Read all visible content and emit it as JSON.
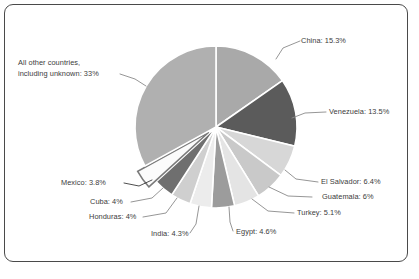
{
  "chart_data": {
    "type": "pie",
    "title": "",
    "xlabel": "",
    "ylabel": "",
    "legend_position": "none",
    "grid": false,
    "unit": "%",
    "start_angle_deg": 0,
    "direction": "clockwise",
    "categories": [
      "China",
      "Venezuela",
      "El Salvador",
      "Guatemala",
      "Turkey",
      "Egypt",
      "India",
      "Honduras",
      "Cuba",
      "Mexico",
      "All other countries, including unknown"
    ],
    "values": [
      15.3,
      13.5,
      6.4,
      6,
      5.1,
      4.6,
      4.3,
      4,
      4,
      3.8,
      33
    ],
    "labels": [
      "China: 15.3%",
      "Venezuela: 13.5%",
      "El Salvador: 6.4%",
      "Guatemala: 6%",
      "Turkey: 5.1%",
      "Egypt: 4.6%",
      "India: 4.3%",
      "Honduras: 4%",
      "Cuba: 4%",
      "Mexico: 3.8%",
      "All other countries, including unknown: 33%"
    ],
    "slice_colors": [
      "#a9a9a9",
      "#5b5b5b",
      "#d7d7d7",
      "#c9c9c9",
      "#e4e4e4",
      "#9c9c9c",
      "#ececec",
      "#cfcfcf",
      "#6f6f6f",
      "#fbfbfb",
      "#b0b0b0"
    ],
    "exploded": [
      "Mexico"
    ]
  },
  "labels": {
    "china": "China: 15.3%",
    "venezuela": "Venezuela: 13.5%",
    "el_salvador": "El Salvador: 6.4%",
    "guatemala": "Guatemala: 6%",
    "turkey": "Turkey: 5.1%",
    "egypt": "Egypt: 4.6%",
    "india": "India: 4.3%",
    "honduras": "Honduras: 4%",
    "cuba": "Cuba: 4%",
    "mexico": "Mexico: 3.8%",
    "all_other_line1": "All other countries,",
    "all_other_line2": "including unknown: 33%"
  },
  "style": {
    "frame_border": "#4a4a4a",
    "background": "#ffffff",
    "leader_line": "#8a8a8a",
    "text": "#3b3b3b",
    "slice_gap": "#ffffff"
  }
}
